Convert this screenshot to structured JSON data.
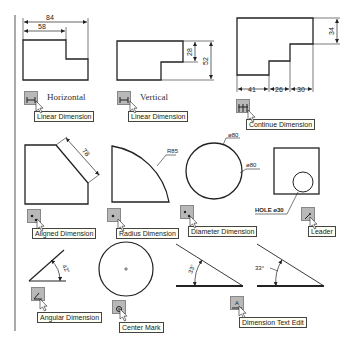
{
  "examples": {
    "horizontal": {
      "label": "Horizontal",
      "tooltip": "Linear Dimension",
      "dims": [
        "84",
        "58"
      ]
    },
    "vertical": {
      "label": "Vertical",
      "tooltip": "Linear Dimension",
      "dims": [
        "28",
        "52"
      ]
    },
    "continue": {
      "tooltip": "Continue Dimension",
      "dims": [
        "41",
        "26",
        "30",
        "34"
      ]
    },
    "aligned": {
      "tooltip": "Aligned Dimension",
      "dims": [
        "78"
      ]
    },
    "radius": {
      "tooltip": "Radius Dimension",
      "dims": [
        "R85"
      ]
    },
    "diameter": {
      "tooltip": "Diameter Dimension",
      "dims": [
        "ø80",
        "ø80"
      ]
    },
    "leader": {
      "tooltip": "Leader",
      "note": "HOLE ø30"
    },
    "angular": {
      "tooltip": "Angular Dimension",
      "dims": [
        "42°"
      ]
    },
    "center_mark": {
      "tooltip": "Center Mark"
    },
    "dim_text_edit": {
      "tooltip": "Dimension Text Edit",
      "dims": [
        "33°",
        "33°"
      ]
    }
  },
  "colors": {
    "line": "#222222",
    "button": "#b8b8b8",
    "tooltip_bg": "#fffff4",
    "border": "#aaaaaa"
  }
}
